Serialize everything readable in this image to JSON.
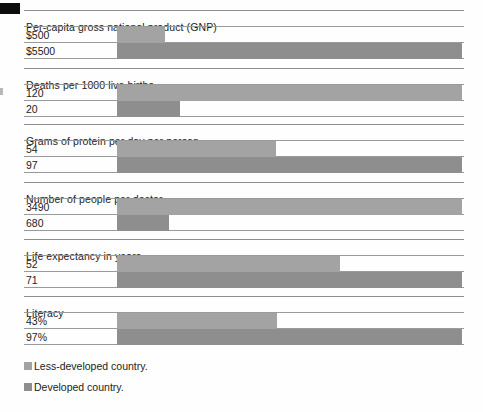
{
  "chart_data": {
    "type": "bar",
    "title": "",
    "orientation": "horizontal",
    "grid": false,
    "legend_position": "bottom-left",
    "categories": [
      "Per-capita gross national product (GNP)",
      "Deaths per 1000 live births",
      "Grams of protein per day per person",
      "Number of people per doctor",
      "Life expectancy in years",
      "Literacy"
    ],
    "series": [
      {
        "name": "Less-developed country.",
        "color": "#a3a3a3",
        "values": [
          500,
          120,
          54,
          3490,
          52,
          43
        ],
        "labels": [
          "$500",
          "120",
          "54",
          "3490",
          "52",
          "43%"
        ]
      },
      {
        "name": "Developed country.",
        "color": "#8e8e8e",
        "values": [
          5500,
          20,
          97,
          680,
          71,
          97
        ],
        "labels": [
          "$5500",
          "20",
          "97",
          "680",
          "71",
          "97%"
        ]
      }
    ],
    "xlabel": "",
    "ylabel": "",
    "note": "Each group is scaled independently; the larger of the two values fills the full plot width."
  },
  "groups": [
    {
      "label": "Per-capita gross national product (GNP)",
      "rows": [
        {
          "value_label": "$500",
          "series": "less",
          "bar_pct": 14.0
        },
        {
          "value_label": "$5500",
          "series": "dev",
          "bar_pct": 100.0
        }
      ]
    },
    {
      "label": "Deaths per 1000 live births",
      "rows": [
        {
          "value_label": "120",
          "series": "less",
          "bar_pct": 100.0
        },
        {
          "value_label": "20",
          "series": "dev",
          "bar_pct": 18.2
        }
      ]
    },
    {
      "label": "Grams of protein per day per person",
      "rows": [
        {
          "value_label": "54",
          "series": "less",
          "bar_pct": 46.1
        },
        {
          "value_label": "97",
          "series": "dev",
          "bar_pct": 100.0
        }
      ]
    },
    {
      "label": "Number of people per doctor",
      "rows": [
        {
          "value_label": "3490",
          "series": "less",
          "bar_pct": 100.0
        },
        {
          "value_label": "680",
          "series": "dev",
          "bar_pct": 15.0
        }
      ]
    },
    {
      "label": "Life expectancy in years",
      "rows": [
        {
          "value_label": "52",
          "series": "less",
          "bar_pct": 64.5
        },
        {
          "value_label": "71",
          "series": "dev",
          "bar_pct": 100.0
        }
      ]
    },
    {
      "label": "Literacy",
      "rows": [
        {
          "value_label": "43%",
          "series": "less",
          "bar_pct": 46.4
        },
        {
          "value_label": "97%",
          "series": "dev",
          "bar_pct": 100.0
        }
      ]
    }
  ],
  "legend": {
    "items": [
      {
        "label": "Less-developed country.",
        "series": "less"
      },
      {
        "label": "Developed country.",
        "series": "dev"
      }
    ]
  },
  "colors": {
    "less_developed": "#a3a3a3",
    "developed": "#8e8e8e",
    "rule": "#9a9a9a",
    "text": "#1c1c1c",
    "background": "#fefefe"
  }
}
